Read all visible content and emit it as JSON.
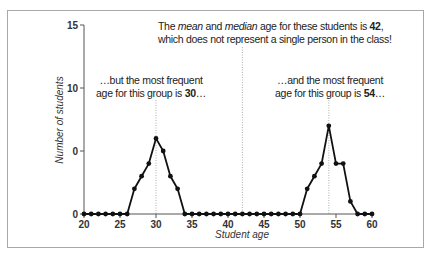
{
  "chart_data": {
    "type": "line",
    "title": "",
    "xlabel": "Student age",
    "ylabel": "Number of students",
    "xlim": [
      20,
      60
    ],
    "ylim": [
      0,
      15
    ],
    "x_ticks": [
      20,
      25,
      30,
      35,
      40,
      45,
      50,
      55,
      60
    ],
    "y_ticks": [
      0,
      5,
      10,
      15
    ],
    "y_tick_labels": [
      "0",
      "0",
      "10",
      "15"
    ],
    "grid": false,
    "legend": null,
    "series": [
      {
        "name": "Number of students by age",
        "x": [
          20,
          21,
          22,
          23,
          24,
          25,
          26,
          27,
          28,
          29,
          30,
          31,
          32,
          33,
          34,
          35,
          36,
          37,
          38,
          39,
          40,
          41,
          42,
          43,
          44,
          45,
          46,
          47,
          48,
          49,
          50,
          51,
          52,
          53,
          54,
          55,
          56,
          57,
          58,
          59,
          60
        ],
        "values": [
          0,
          0,
          0,
          0,
          0,
          0,
          0,
          2,
          3,
          4,
          6,
          5,
          3,
          2,
          0,
          0,
          0,
          0,
          0,
          0,
          0,
          0,
          0,
          0,
          0,
          0,
          0,
          0,
          0,
          0,
          0,
          2,
          3,
          4,
          7,
          4,
          4,
          1,
          0,
          0,
          0
        ]
      }
    ],
    "reference_lines": [
      {
        "x": 30,
        "style": "dotted",
        "label": "mode (group 1)"
      },
      {
        "x": 42,
        "style": "dotted",
        "label": "mean/median"
      },
      {
        "x": 54,
        "style": "dotted",
        "label": "mode (group 2)"
      }
    ],
    "annotations": [
      {
        "id": "mean_median",
        "x": 42,
        "text_parts": [
          {
            "t": "The ",
            "s": "normal"
          },
          {
            "t": "mean",
            "s": "italic"
          },
          {
            "t": " and ",
            "s": "normal"
          },
          {
            "t": "median",
            "s": "italic"
          },
          {
            "t": " age for these students is ",
            "s": "normal"
          },
          {
            "t": "42",
            "s": "bold"
          },
          {
            "t": ",",
            "s": "normal"
          }
        ],
        "line2": "which does not represent a single person in the class!"
      },
      {
        "id": "mode_30",
        "x": 30,
        "line1": "…but the most frequent",
        "line2_prefix": "age for this group is ",
        "line2_value": "30",
        "line2_suffix": "…"
      },
      {
        "id": "mode_54",
        "x": 54,
        "line1": "…and the most frequent",
        "line2_prefix": "age for this group is ",
        "line2_value": "54",
        "line2_suffix": "…"
      }
    ]
  },
  "colors": {
    "line": "#111111",
    "marker": "#111111",
    "axis": "#555555",
    "reference_line": "#9a9a9a",
    "frame_border": "#a8a8a8",
    "text": "#222222"
  }
}
